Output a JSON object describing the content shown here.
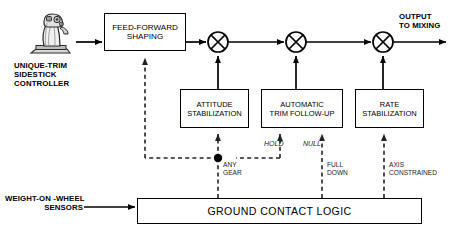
{
  "diagram": {
    "colors": {
      "line": "#000000",
      "dashed": "#333333",
      "box_fill": "#ffffff"
    },
    "source_label": {
      "line1": "UNIQUE-TRIM",
      "line2": "SIDESTICK",
      "line3": "CONTROLLER",
      "icon": "sidestick-controller-icon"
    },
    "sensor_label": {
      "line1": "WEIGHT-ON -WHEEL",
      "line2": "SENSORS"
    },
    "output_label": {
      "line1": "OUTPUT",
      "line2": "TO MIXING"
    },
    "blocks": [
      {
        "id": "feed-forward-shaping",
        "line1": "FEED-FORWARD",
        "line2": "SHAPING",
        "x": 104,
        "y": 13,
        "w": 80,
        "h": 36
      },
      {
        "id": "attitude-stabilization",
        "line1": "ATTITUDE",
        "line2": "STABILIZATION",
        "x": 180,
        "y": 89,
        "w": 67,
        "h": 37
      },
      {
        "id": "automatic-trim-follow-up",
        "line1": "AUTOMATIC",
        "line2": "TRIM FOLLOW-UP",
        "x": 261,
        "y": 89,
        "w": 80,
        "h": 37
      },
      {
        "id": "rate-stabilization",
        "line1": "RATE",
        "line2": "STABILIZATION",
        "x": 355,
        "y": 89,
        "w": 67,
        "h": 37
      },
      {
        "id": "ground-contact-logic",
        "line1": "GROUND CONTACT LOGIC",
        "line2": "",
        "x": 137,
        "y": 198,
        "w": 283,
        "h": 24
      }
    ],
    "summing_junctions": [
      {
        "id": "sum-1",
        "symbol": "X",
        "cx": 218,
        "cy": 42,
        "r": 10
      },
      {
        "id": "sum-2",
        "symbol": "X",
        "cx": 296,
        "cy": 42,
        "r": 10
      },
      {
        "id": "sum-3",
        "symbol": "X",
        "cx": 383,
        "cy": 42,
        "r": 10
      }
    ],
    "mode_labels": [
      {
        "id": "hold",
        "text": "HOLD",
        "style": "italic",
        "x": 264,
        "y": 140
      },
      {
        "id": "null",
        "text": "NULL",
        "style": "italic",
        "x": 302,
        "y": 140
      }
    ],
    "discrete_labels": [
      {
        "id": "any-gear",
        "line1": "ANY",
        "line2": "GEAR",
        "x": 222,
        "y": 161
      },
      {
        "id": "full-down",
        "line1": "FULL",
        "line2": "DOWN",
        "x": 301,
        "y": 161
      },
      {
        "id": "axis-constrained",
        "line1": "AXIS",
        "line2": "CONSTRAINED",
        "x": 389,
        "y": 161
      }
    ],
    "junction_dot": {
      "id": "any-gear-branch-node",
      "cx": 218,
      "cy": 158,
      "r": 4
    }
  }
}
